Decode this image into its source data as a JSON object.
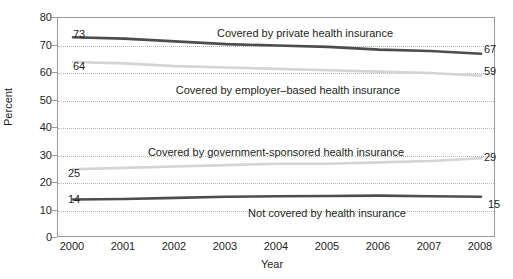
{
  "chart_data": {
    "type": "line",
    "title": "",
    "xlabel": "Year",
    "ylabel": "Percent",
    "x": [
      2000,
      2001,
      2002,
      2003,
      2004,
      2005,
      2006,
      2007,
      2008
    ],
    "xlim": [
      2000,
      2008
    ],
    "ylim": [
      0,
      80
    ],
    "yticks": [
      0,
      10,
      20,
      30,
      40,
      50,
      60,
      70,
      80
    ],
    "xticks": [
      "2000",
      "2001",
      "2002",
      "2003",
      "2004",
      "2005",
      "2006",
      "2007",
      "2008"
    ],
    "grid": "horizontal-dotted",
    "legend": "inline-annotations",
    "series": [
      {
        "name": "Covered by private health insurance",
        "color": "#4d4d4d",
        "values": [
          73,
          72.5,
          71.5,
          70.5,
          70,
          69.5,
          68.5,
          68,
          67
        ],
        "start_label": "73",
        "end_label": "67"
      },
      {
        "name": "Covered by employer-based health insurance",
        "color": "#d4d4d4",
        "values": [
          64,
          63.5,
          62.5,
          62,
          61.5,
          61,
          60.5,
          60,
          59
        ],
        "start_label": "64",
        "end_label": "59"
      },
      {
        "name": "Covered by government-sponsored health insurance",
        "color": "#d4d4d4",
        "values": [
          25,
          25.5,
          26,
          26.5,
          27,
          27,
          27.5,
          28,
          29
        ],
        "start_label": "25",
        "end_label": "29"
      },
      {
        "name": "Not covered by health insurance",
        "color": "#4d4d4d",
        "values": [
          14,
          14.2,
          14.6,
          15,
          15.2,
          15.3,
          15.4,
          15.2,
          15
        ],
        "start_label": "14",
        "end_label": "15"
      }
    ],
    "annotations": [
      {
        "text": "Covered by private health insurance",
        "x_px": 305,
        "y_px": 28
      },
      {
        "text": "Covered by employer–based health insurance",
        "x_px": 288,
        "y_px": 85
      },
      {
        "text": "Covered by government-sponsored health insurance",
        "x_px": 276,
        "y_px": 147
      },
      {
        "text": "Not covered by health insurance",
        "x_px": 327,
        "y_px": 208
      }
    ],
    "endpoint_labels": [
      {
        "text": "73",
        "x_px": 73,
        "y_px": 29
      },
      {
        "text": "67",
        "x_px": 484,
        "y_px": 44
      },
      {
        "text": "64",
        "x_px": 73,
        "y_px": 61
      },
      {
        "text": "59",
        "x_px": 484,
        "y_px": 66
      },
      {
        "text": "25",
        "x_px": 68,
        "y_px": 168
      },
      {
        "text": "29",
        "x_px": 484,
        "y_px": 152
      },
      {
        "text": "14",
        "x_px": 68,
        "y_px": 194
      },
      {
        "text": "15",
        "x_px": 488,
        "y_px": 199
      }
    ]
  }
}
